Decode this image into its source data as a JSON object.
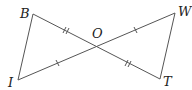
{
  "diagram": {
    "type": "geometry",
    "points": {
      "B": {
        "label": "B",
        "x": 33,
        "y": 14
      },
      "O": {
        "label": "O",
        "x": 96,
        "y": 47
      },
      "W": {
        "label": "W",
        "x": 175,
        "y": 13
      },
      "I": {
        "label": "I",
        "x": 18,
        "y": 80
      },
      "T": {
        "label": "T",
        "x": 160,
        "y": 79
      }
    },
    "segments": [
      {
        "from": "B",
        "to": "I"
      },
      {
        "from": "B",
        "to": "O"
      },
      {
        "from": "O",
        "to": "T"
      },
      {
        "from": "I",
        "to": "O"
      },
      {
        "from": "O",
        "to": "W"
      },
      {
        "from": "W",
        "to": "T"
      }
    ],
    "congruence_marks": [
      {
        "segment": "BO",
        "ticks": 2
      },
      {
        "segment": "OT",
        "ticks": 2
      },
      {
        "segment": "IO",
        "ticks": 1
      },
      {
        "segment": "OW",
        "ticks": 1
      }
    ],
    "stroke_color": "#555555",
    "label_color": "#222222"
  }
}
